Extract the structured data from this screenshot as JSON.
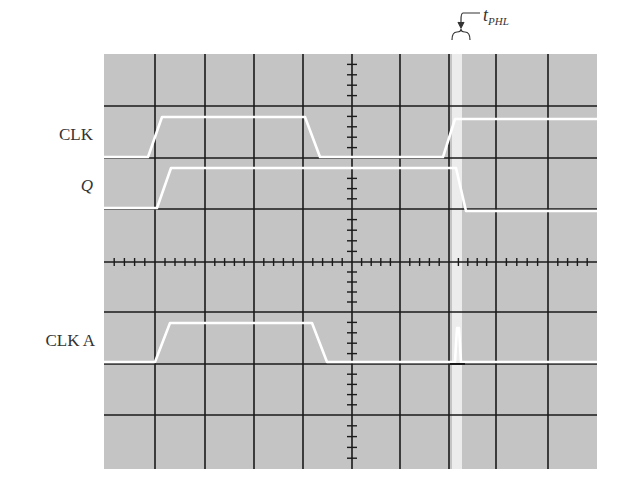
{
  "figure": {
    "type": "oscilloscope-timing-diagram",
    "grid": {
      "horizontal_divisions": 10,
      "vertical_divisions": 8,
      "minor_ticks_per_division": 5,
      "background": "#c4c4c4",
      "grid_line_color": "#1a1a1a",
      "trace_color": "#ffffff"
    },
    "traces": [
      {
        "name": "CLK",
        "label": "CLK",
        "italic": false,
        "points": [
          [
            104,
            157
          ],
          [
            148,
            157
          ],
          [
            162,
            117
          ],
          [
            305,
            117
          ],
          [
            320,
            157
          ],
          [
            443,
            157
          ],
          [
            455,
            119
          ],
          [
            597,
            119
          ]
        ]
      },
      {
        "name": "Q",
        "label": "Q",
        "italic": true,
        "points": [
          [
            104,
            208
          ],
          [
            157,
            208
          ],
          [
            171,
            168
          ],
          [
            456,
            168
          ],
          [
            466,
            211
          ],
          [
            597,
            211
          ]
        ]
      },
      {
        "name": "CLK A",
        "label": "CLK A",
        "italic": false,
        "points": [
          [
            104,
            362
          ],
          [
            155,
            362
          ],
          [
            170,
            323
          ],
          [
            312,
            323
          ],
          [
            327,
            362
          ],
          [
            455,
            362
          ],
          [
            457,
            328
          ],
          [
            459,
            328
          ],
          [
            461,
            362
          ],
          [
            597,
            362
          ]
        ]
      }
    ],
    "annotation": {
      "text": "t",
      "subscript": "PHL",
      "meaning": "propagation delay high-to-low"
    }
  }
}
